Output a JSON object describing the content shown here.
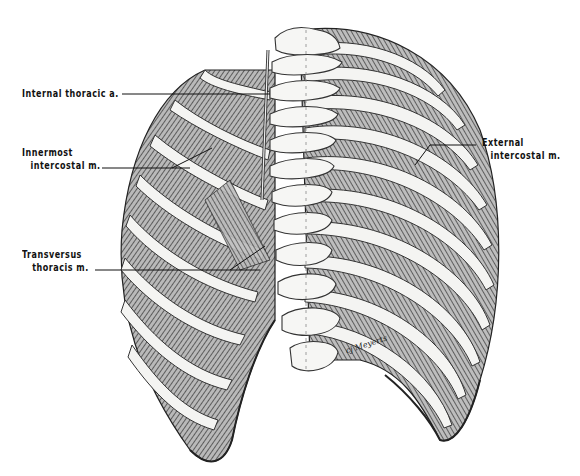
{
  "figure": {
    "labels": [
      {
        "id": "internal-thoracic-a",
        "lines": [
          "Internal thoracic a."
        ]
      },
      {
        "id": "innermost-intercostal-m",
        "lines": [
          "Innermost",
          "intercostal m."
        ]
      },
      {
        "id": "transversus-thoracis-m",
        "lines": [
          "Transversus",
          "thoracis m."
        ]
      },
      {
        "id": "external-intercostal-m",
        "lines": [
          "External",
          "intercostal m."
        ]
      }
    ],
    "signature": "cj Meyerts",
    "colors": {
      "background": "#ffffff",
      "ink": "#111111",
      "bone": "#f2f2f0",
      "muscle_shade": "#6b6b6b"
    }
  }
}
